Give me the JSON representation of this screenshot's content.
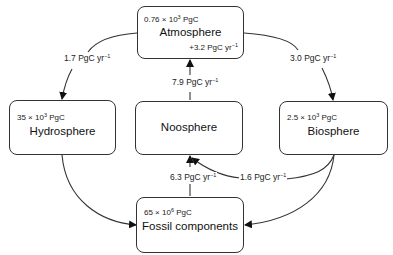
{
  "diagram": {
    "nodes": {
      "atmosphere": {
        "name": "Atmosphere",
        "amount_base": "0.76 × 10",
        "amount_exp": "3",
        "amount_unit": " PgC",
        "note_value": "+3.2 PgC yr",
        "note_exp": "−1"
      },
      "hydrosphere": {
        "name": "Hydrosphere",
        "amount_base": "35 × 10",
        "amount_exp": "3",
        "amount_unit": " PgC"
      },
      "noosphere": {
        "name": "Noosphere"
      },
      "biosphere": {
        "name": "Biosphere",
        "amount_base": "2.5 × 10",
        "amount_exp": "3",
        "amount_unit": " PgC"
      },
      "fossil": {
        "name": "Fossil components",
        "amount_base": "65 × 10",
        "amount_exp": "6",
        "amount_unit": " PgC"
      }
    },
    "flows": {
      "atmosphere_to_hydrosphere": {
        "value": "1.7 PgC yr",
        "exp": "−1",
        "from": "Atmosphere",
        "to": "Hydrosphere"
      },
      "atmosphere_to_biosphere": {
        "value": "3.0 PgC yr",
        "exp": "−1",
        "from": "Atmosphere",
        "to": "Biosphere"
      },
      "noosphere_to_atmosphere": {
        "value": "7.9 PgC yr",
        "exp": "−1",
        "from": "Noosphere",
        "to": "Atmosphere"
      },
      "fossil_to_noosphere": {
        "value": "6.3 PgC yr",
        "exp": "−1",
        "from": "Fossil components",
        "to": "Noosphere"
      },
      "biosphere_to_noosphere": {
        "value": "1.6 PgC yr",
        "exp": "−1",
        "from": "Biosphere",
        "to": "Noosphere"
      },
      "hydrosphere_to_fossil": {
        "from": "Hydrosphere",
        "to": "Fossil components"
      },
      "biosphere_to_fossil": {
        "from": "Biosphere",
        "to": "Fossil components"
      }
    }
  }
}
